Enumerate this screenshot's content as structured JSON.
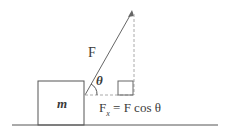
{
  "diagram": {
    "mass_label": "m",
    "force_label": "F",
    "angle_label": "θ",
    "component_label_prefix": "F",
    "component_subscript": "x",
    "component_equation": "= F cos θ",
    "colors": {
      "line": "#555555",
      "dashed": "#9a9a9a",
      "text": "#3a3a3a"
    }
  }
}
